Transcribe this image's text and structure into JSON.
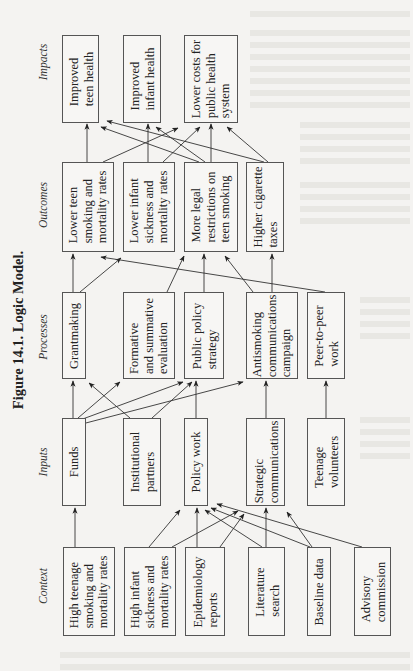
{
  "figure": {
    "title": "Figure 14.1.  Logic Model."
  },
  "columns": {
    "context": "Context",
    "inputs": "Inputs",
    "processes": "Processes",
    "outcomes": "Outcomes",
    "impacts": "Impacts"
  },
  "context": [
    {
      "label": "High teenage\nsmoking and\nmortality rates"
    },
    {
      "label": "High infant\nsickness and\nmortality rates"
    },
    {
      "label": "Epidemiology\nreports"
    },
    {
      "label": "Literature\nsearch"
    },
    {
      "label": "Baseline data"
    },
    {
      "label": "Advisory\ncommission"
    }
  ],
  "inputs": [
    {
      "label": "Funds"
    },
    {
      "label": "Institutional\npartners"
    },
    {
      "label": "Policy work"
    },
    {
      "label": "Strategic\ncommunications"
    },
    {
      "label": "Teenage\nvolunteers"
    }
  ],
  "processes": [
    {
      "label": "Grantmaking"
    },
    {
      "label": "Formative\nand summative\nevaluation"
    },
    {
      "label": "Public policy\nstrategy"
    },
    {
      "label": "Antismoking\ncommunications\ncampaign"
    },
    {
      "label": "Peer-to-peer\nwork"
    }
  ],
  "outcomes": [
    {
      "label": "Lower teen\nsmoking and\nmortality rates"
    },
    {
      "label": "Lower infant\nsickness and\nmortality rates"
    },
    {
      "label": "More legal\nrestrictions on\nteen smoking"
    },
    {
      "label": "Higher cigarette\ntaxes"
    }
  ],
  "impacts": [
    {
      "label": "Improved\nteen health"
    },
    {
      "label": "Improved\ninfant health"
    },
    {
      "label": "Lower costs for\npublic health\nsystem"
    }
  ],
  "edges": [
    [
      "context.0",
      "inputs.0"
    ],
    [
      "context.1",
      "inputs.2"
    ],
    [
      "context.1",
      "inputs.3"
    ],
    [
      "context.2",
      "inputs.2"
    ],
    [
      "context.2",
      "inputs.3"
    ],
    [
      "context.3",
      "inputs.2"
    ],
    [
      "context.3",
      "inputs.3"
    ],
    [
      "context.4",
      "inputs.2"
    ],
    [
      "context.4",
      "inputs.3"
    ],
    [
      "context.5",
      "inputs.2"
    ],
    [
      "inputs.0",
      "processes.0"
    ],
    [
      "inputs.0",
      "processes.1"
    ],
    [
      "inputs.0",
      "processes.2"
    ],
    [
      "inputs.0",
      "processes.3"
    ],
    [
      "inputs.1",
      "processes.0"
    ],
    [
      "inputs.1",
      "processes.2"
    ],
    [
      "inputs.2",
      "processes.2"
    ],
    [
      "inputs.3",
      "processes.3"
    ],
    [
      "inputs.4",
      "processes.4"
    ],
    [
      "processes.0",
      "outcomes.0"
    ],
    [
      "processes.0",
      "outcomes.1"
    ],
    [
      "processes.1",
      "outcomes.2"
    ],
    [
      "processes.2",
      "outcomes.2"
    ],
    [
      "processes.3",
      "outcomes.2"
    ],
    [
      "processes.3",
      "outcomes.3"
    ],
    [
      "processes.4",
      "outcomes.0"
    ],
    [
      "outcomes.0",
      "impacts.0"
    ],
    [
      "outcomes.0",
      "impacts.1"
    ],
    [
      "outcomes.1",
      "impacts.1"
    ],
    [
      "outcomes.1",
      "impacts.2"
    ],
    [
      "outcomes.2",
      "impacts.0"
    ],
    [
      "outcomes.2",
      "impacts.1"
    ],
    [
      "outcomes.2",
      "impacts.2"
    ],
    [
      "outcomes.3",
      "impacts.0"
    ],
    [
      "outcomes.3",
      "impacts.2"
    ]
  ]
}
